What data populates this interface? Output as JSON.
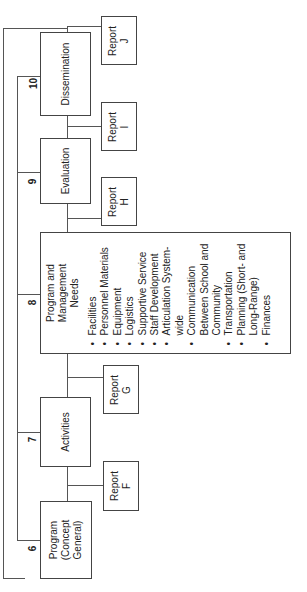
{
  "diagram": {
    "stages": [
      {
        "number": "6",
        "label": "Program\n(Concept\nGeneral)"
      },
      {
        "number": "7",
        "label": "Activities"
      },
      {
        "number": "8",
        "label": "Program and\nManagement\nNeeds"
      },
      {
        "number": "9",
        "label": "Evaluation"
      },
      {
        "number": "10",
        "label": "Dissemination"
      }
    ],
    "reports": [
      {
        "label": "Report\nF"
      },
      {
        "label": "Report\nG"
      },
      {
        "label": "Report\nH"
      },
      {
        "label": "Report\nI"
      },
      {
        "label": "Report\nJ"
      }
    ],
    "needs_items": [
      "Facilities",
      "Personnel Materials",
      "Equipment",
      "Logistics",
      "Supportive Service",
      "Staff Development",
      "Articulation System-wide",
      "Communication Between School and Community",
      "Transportation",
      "Planning (Short- and Long-Range)",
      "Finances"
    ],
    "line_color": "#555555",
    "box_border_color": "#444444"
  }
}
